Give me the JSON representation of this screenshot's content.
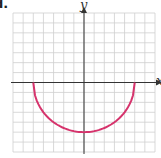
{
  "part_label": "d.",
  "chart_data": {
    "type": "line",
    "title": "",
    "xlabel": "x",
    "ylabel": "y",
    "xlim": [
      -7,
      7
    ],
    "ylim": [
      -7,
      7
    ],
    "grid": true,
    "grid_step": 1,
    "series": [
      {
        "name": "lower semicircle",
        "equation": "y = -sqrt(25 - x^2)",
        "color": "#d6336c",
        "x": [
          -5,
          -4,
          -3,
          -2,
          -1,
          0,
          1,
          2,
          3,
          4,
          5
        ],
        "values": [
          0,
          -3,
          -4,
          -4.58,
          -4.9,
          -5,
          -4.9,
          -4.58,
          -4,
          -3,
          0
        ]
      }
    ]
  },
  "colors": {
    "grid": "#cfcfcf",
    "axis": "#333333",
    "curve": "#d6336c"
  }
}
